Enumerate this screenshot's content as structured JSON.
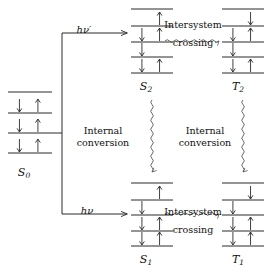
{
  "figure": {
    "kind": "jablonski-energy-level-diagram",
    "background_color": "#ffffff",
    "ink_color": "#2b2b2b",
    "width": 267,
    "height": 268
  },
  "states": [
    {
      "id": "S0",
      "label": "S",
      "subscript": "0",
      "label_x": 24,
      "label_y": 166,
      "manifold_x": 8,
      "manifold_width": 44,
      "levels": [
        {
          "y": 92,
          "electrons": []
        },
        {
          "y": 113,
          "electrons": [
            "down",
            "up"
          ]
        },
        {
          "y": 133,
          "electrons": [
            "down",
            "up"
          ]
        },
        {
          "y": 153,
          "electrons": [
            "down",
            "up"
          ]
        }
      ]
    },
    {
      "id": "S2",
      "label": "S",
      "subscript": "2",
      "label_x": 146,
      "label_y": 80,
      "manifold_x": 131,
      "manifold_width": 42,
      "levels": [
        {
          "y": 9,
          "electrons": []
        },
        {
          "y": 26,
          "electrons": [
            "up-upper"
          ]
        },
        {
          "y": 42,
          "electrons": [
            "down",
            "up"
          ]
        },
        {
          "y": 57,
          "electrons": [
            "down"
          ]
        },
        {
          "y": 73,
          "electrons": [
            "down",
            "up"
          ]
        }
      ]
    },
    {
      "id": "T2",
      "label": "T",
      "subscript": "2",
      "label_x": 238,
      "label_y": 80,
      "manifold_x": 222,
      "manifold_width": 42,
      "levels": [
        {
          "y": 9,
          "electrons": []
        },
        {
          "y": 26,
          "electrons": [
            "down-upper"
          ]
        },
        {
          "y": 42,
          "electrons": [
            "down",
            "up"
          ]
        },
        {
          "y": 57,
          "electrons": [
            "down"
          ]
        },
        {
          "y": 73,
          "electrons": [
            "down",
            "up"
          ]
        }
      ]
    },
    {
      "id": "S1",
      "label": "S",
      "subscript": "1",
      "label_x": 146,
      "label_y": 253,
      "manifold_x": 131,
      "manifold_width": 42,
      "levels": [
        {
          "y": 183,
          "electrons": []
        },
        {
          "y": 200,
          "electrons": [
            "up-upper"
          ]
        },
        {
          "y": 215,
          "electrons": [
            "down"
          ]
        },
        {
          "y": 231,
          "electrons": [
            "down",
            "up"
          ]
        },
        {
          "y": 246,
          "electrons": [
            "down",
            "up"
          ]
        }
      ]
    },
    {
      "id": "T1",
      "label": "T",
      "subscript": "1",
      "label_x": 238,
      "label_y": 253,
      "manifold_x": 222,
      "manifold_width": 42,
      "levels": [
        {
          "y": 183,
          "electrons": []
        },
        {
          "y": 200,
          "electrons": [
            "down-upper"
          ]
        },
        {
          "y": 215,
          "electrons": [
            "down"
          ]
        },
        {
          "y": 231,
          "electrons": [
            "down",
            "up"
          ]
        },
        {
          "y": 246,
          "electrons": [
            "down",
            "up"
          ]
        }
      ]
    }
  ],
  "transitions": {
    "absorption_upper": {
      "label": "hν′",
      "label_x": 84,
      "label_y": 24,
      "from": "S0",
      "to": "S2"
    },
    "absorption_lower": {
      "label": "hν",
      "label_x": 87,
      "label_y": 205,
      "from": "S0",
      "to": "S1"
    },
    "intersystem_crossing_upper": {
      "line1": "Intersystem",
      "line2": "crossing",
      "label_x": 193,
      "label_y": 19,
      "from": "S2",
      "to": "T2"
    },
    "intersystem_crossing_lower": {
      "line1": "Intersystem",
      "line2": "crossing",
      "label_x": 193,
      "label_y": 206,
      "from": "S1",
      "to": "T1"
    },
    "internal_conversion_singlet": {
      "line1": "Internal",
      "line2": "conversion",
      "label_x": 103,
      "label_y": 125,
      "from": "S2",
      "to": "S1"
    },
    "internal_conversion_triplet": {
      "line1": "Internal",
      "line2": "conversion",
      "label_x": 205,
      "label_y": 125,
      "from": "T2",
      "to": "T1"
    }
  }
}
